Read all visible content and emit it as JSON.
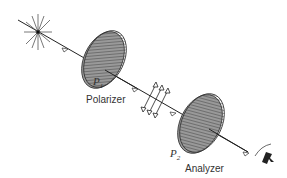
{
  "labels": {
    "polarizer": "Polarizer",
    "analyzer": "Analyzer",
    "p1": "P",
    "p1_sub": "1",
    "p2": "P",
    "p2_sub": "2"
  },
  "colors": {
    "line": "#222222",
    "disk_fill": "#bdbdbd",
    "hatch": "#444444"
  }
}
